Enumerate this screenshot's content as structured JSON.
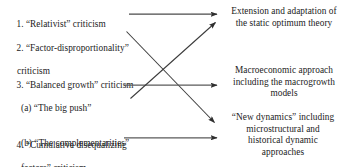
{
  "diagram": {
    "type": "flow-mapping",
    "title": "",
    "left_column": [
      {
        "id": "item-1",
        "number": "1.",
        "lines": [
          "1. “Relativist” criticism"
        ]
      },
      {
        "id": "item-2",
        "number": "2.",
        "lines": [
          "2. “Factor-disproportionality”",
          "criticism"
        ]
      },
      {
        "id": "item-3",
        "number": "3.",
        "lines": [
          "3. “Balanced growth” criticism",
          "(a) “The big push”",
          "(b) “The complementarities”"
        ]
      },
      {
        "id": "item-4",
        "number": "4.",
        "lines": [
          "4. “Cumulative disequalizing",
          "factors” criticism"
        ]
      }
    ],
    "right_column": [
      {
        "id": "outcome-1",
        "lines": [
          "Extension and adaptation of",
          "the static optimum theory"
        ]
      },
      {
        "id": "outcome-2",
        "lines": [
          "Macroeconomic approach",
          "including the macrogrowth",
          "models"
        ]
      },
      {
        "id": "outcome-3",
        "lines": [
          "“New dynamics” including",
          "microstructural and",
          "historical dynamic",
          "approaches"
        ]
      }
    ],
    "connections": [
      {
        "id": "arrow-1-to-outcome-1",
        "from": "item-1",
        "to": "outcome-1",
        "shape": "horizontal"
      },
      {
        "id": "arrow-2-to-outcome-3",
        "from": "item-2",
        "to": "outcome-3",
        "shape": "diagonal-down"
      },
      {
        "id": "arrow-3-to-outcome-2",
        "from": "item-3",
        "to": "outcome-2",
        "shape": "horizontal"
      },
      {
        "id": "arrow-3b-to-outcome-1",
        "from": "item-3",
        "to": "outcome-1",
        "shape": "diagonal-up"
      },
      {
        "id": "arrow-4-to-outcome-3",
        "from": "item-4",
        "to": "outcome-3",
        "shape": "horizontal"
      }
    ],
    "colors": {
      "text": "#222222",
      "arrow": "#3a3a3a",
      "background": "#ffffff"
    }
  }
}
